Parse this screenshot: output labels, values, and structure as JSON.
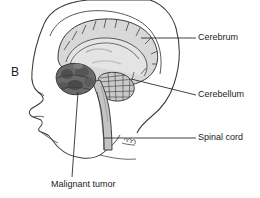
{
  "figure": {
    "panel_letter": "B",
    "background_color": "#ffffff",
    "width": 260,
    "height": 198
  },
  "labels": {
    "cerebrum": "Cerebrum",
    "cerebellum": "Cerebellum",
    "spinal_cord": "Spinal cord",
    "malignant_tumor": "Malignant tumor"
  },
  "colors": {
    "outline": "#3a3a3a",
    "brain_fill": "#d8d8d8",
    "brain_fill_light": "#e4e4e4",
    "cerebellum_fill": "#c9c9c9",
    "tumor_fill": "#6a6a6a",
    "tumor_fill_dark": "#4f4f4f",
    "brainstem_fill": "#c4c4c4",
    "leader_line": "#2e2e2e",
    "text": "#1c1c1c",
    "skin_fill": "#ffffff"
  },
  "structures": [
    {
      "name": "cerebrum",
      "label": "Cerebrum",
      "fill": "#d8d8d8"
    },
    {
      "name": "cerebellum",
      "label": "Cerebellum",
      "fill": "#c9c9c9"
    },
    {
      "name": "spinal-cord",
      "label": "Spinal cord",
      "fill": "#c4c4c4"
    },
    {
      "name": "malignant-tumor",
      "label": "Malignant tumor",
      "fill": "#6a6a6a"
    }
  ]
}
